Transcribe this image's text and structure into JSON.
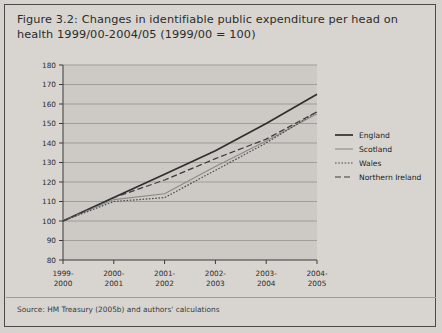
{
  "figure": {
    "title": "Figure 3.2: Changes in identifiable public expenditure per head on health 1999/00-2004/05 (1999/00 = 100)",
    "source": "Source: HM Treasury (2005b) and authors' calculations"
  },
  "chart_data": {
    "type": "line",
    "title": "Figure 3.2: Changes in identifiable public expenditure per head on health 1999/00-2004/05 (1999/00 = 100)",
    "xlabel": "",
    "ylabel": "",
    "ylim": [
      80,
      180
    ],
    "ytick_step": 10,
    "yticks": [
      80,
      90,
      100,
      110,
      120,
      130,
      140,
      150,
      160,
      170,
      180
    ],
    "grid": true,
    "legend_position": "right",
    "categories": [
      "1999-2000",
      "2000-2001",
      "2001-2002",
      "2002-2003",
      "2003-2004",
      "2004-2005"
    ],
    "series": [
      {
        "name": "England",
        "style": "solid",
        "color": "#2f2f2f",
        "values": [
          100,
          112,
          124,
          136,
          150,
          165
        ]
      },
      {
        "name": "Scotland",
        "style": "thin",
        "color": "#8a8a8a",
        "values": [
          100,
          111,
          114,
          128,
          141,
          155
        ]
      },
      {
        "name": "Wales",
        "style": "dotted",
        "color": "#4a4a4a",
        "values": [
          100,
          110,
          112,
          126,
          140,
          156
        ]
      },
      {
        "name": "Northern Ireland",
        "style": "dashed",
        "color": "#3a3a3a",
        "values": [
          100,
          112,
          121,
          132,
          142,
          156
        ]
      }
    ]
  }
}
